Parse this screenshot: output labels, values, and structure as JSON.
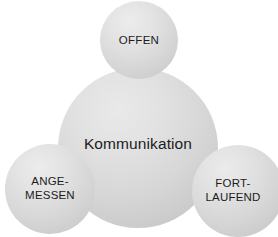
{
  "diagram": {
    "type": "bubble-cluster",
    "background_color": "#ffffff",
    "text_color": "#1c1c1c",
    "bubble_fill_light": "#ececec",
    "bubble_fill_dark": "#c2c2c2",
    "center": {
      "id": "kommunikation",
      "label": "Kommunikation"
    },
    "satellites": [
      {
        "id": "offen",
        "label": "OFFEN",
        "position": "top"
      },
      {
        "id": "angemessen",
        "label": "ANGE-\nMESSEN",
        "position": "bottom-left"
      },
      {
        "id": "fortlaufend",
        "label": "FORT-\nLAUFEND",
        "position": "bottom-right"
      }
    ]
  }
}
